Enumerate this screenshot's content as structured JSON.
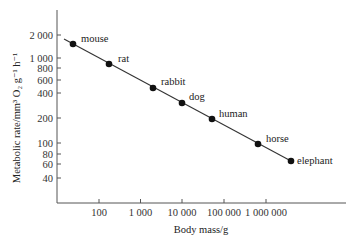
{
  "chart_data": {
    "type": "scatter",
    "title": "",
    "xlabel": "Body mass/g",
    "ylabel": "Metabolic rate/mm³ O₂ g⁻¹ h⁻¹",
    "x_scale": "log",
    "y_scale": "log",
    "x_ticks": [
      100,
      1000,
      10000,
      100000,
      1000000
    ],
    "x_tick_labels": [
      "100",
      "1 000",
      "10 000",
      "100 000",
      "1 000 000"
    ],
    "y_ticks": [
      2000,
      1000,
      800,
      600,
      400,
      200,
      100,
      80,
      60,
      40
    ],
    "y_tick_labels": [
      "2 000",
      "1 000",
      "800",
      "600",
      "400",
      "200",
      "100",
      "80",
      "60",
      "40"
    ],
    "grid": false,
    "legend": null,
    "fit_line": true,
    "points": [
      {
        "label": "mouse",
        "x": 25,
        "y": 1550
      },
      {
        "label": "rat",
        "x": 180,
        "y": 880
      },
      {
        "label": "rabbit",
        "x": 2000,
        "y": 460
      },
      {
        "label": "dog",
        "x": 10000,
        "y": 300
      },
      {
        "label": "human",
        "x": 50000,
        "y": 195
      },
      {
        "label": "horse",
        "x": 650000,
        "y": 97
      },
      {
        "label": "elephant",
        "x": 4000000,
        "y": 62
      }
    ]
  },
  "layout": {
    "plot": {
      "x0": 57,
      "x1": 346,
      "y0": 10,
      "y1": 203
    },
    "xpix": {
      "100": 99,
      "1000": 140.5,
      "10000": 182,
      "100000": 224,
      "1000000": 266
    },
    "ypix": {
      "2000": 35,
      "1000": 58,
      "800": 68,
      "600": 80,
      "400": 93,
      "200": 118,
      "100": 143,
      "80": 154,
      "60": 164,
      "40": 178
    },
    "points_px": [
      {
        "cx": 73,
        "cy": 44,
        "lx": 81,
        "ly": 42
      },
      {
        "cx": 109,
        "cy": 64,
        "lx": 118,
        "ly": 62
      },
      {
        "cx": 153,
        "cy": 88,
        "lx": 161,
        "ly": 85
      },
      {
        "cx": 182,
        "cy": 103,
        "lx": 189,
        "ly": 100
      },
      {
        "cx": 212,
        "cy": 119,
        "lx": 219,
        "ly": 117
      },
      {
        "cx": 258,
        "cy": 144,
        "lx": 266,
        "ly": 142
      },
      {
        "cx": 291,
        "cy": 161,
        "lx": 297,
        "ly": 164
      }
    ],
    "line": {
      "x1": 64,
      "y1": 39,
      "x2": 291,
      "y2": 161
    }
  }
}
